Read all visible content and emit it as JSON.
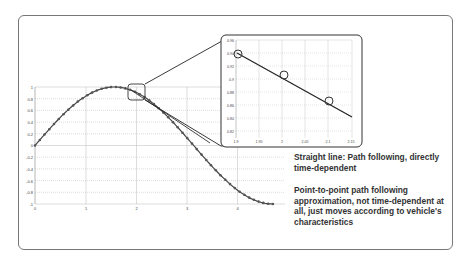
{
  "captions": {
    "straight_line": "Straight line: Path following, directly time-dependent",
    "point_to_point": "Point-to-point path following approximation, not time-dependent at all, just moves according to vehicle's characteristics"
  },
  "chart_data": [
    {
      "type": "line",
      "title": "",
      "xlabel": "",
      "ylabel": "",
      "x_ticks": [
        "0",
        "1",
        "2",
        "3",
        "4"
      ],
      "y_ticks": [
        "1",
        "0.8",
        "0.6",
        "0.4",
        "0.2",
        "0",
        "-0.2",
        "-0.4",
        "-0.6",
        "-0.8",
        "-1"
      ],
      "xlim": [
        0,
        4.9
      ],
      "ylim": [
        -1,
        1
      ],
      "grid": true,
      "series": [
        {
          "name": "Point-to-point approximation (markers)",
          "function": "sin(x)",
          "x_range": [
            0,
            4.71
          ],
          "markers": true
        },
        {
          "name": "Straight line path following",
          "x": [
            1.9,
            2.45
          ],
          "y": [
            0.945,
            0.63
          ]
        }
      ]
    },
    {
      "type": "line",
      "title": "Zoomed inset",
      "x_ticks": [
        "1.9",
        "1.95",
        "2",
        "2.05",
        "2.1",
        "2.15"
      ],
      "y_ticks": [
        "0.96",
        "0.94",
        "0.92",
        "0.9",
        "0.88",
        "0.86",
        "0.84",
        "0.82"
      ],
      "xlim": [
        1.9,
        2.15
      ],
      "ylim": [
        0.81,
        0.96
      ],
      "grid": true,
      "series": [
        {
          "name": "Straight line",
          "x": [
            1.9,
            2.15
          ],
          "y": [
            0.945,
            0.835
          ]
        },
        {
          "name": "Waypoints",
          "x": [
            1.9,
            2.0,
            2.1
          ],
          "y": [
            0.945,
            0.909,
            0.863
          ],
          "marker": "circle"
        }
      ]
    }
  ]
}
